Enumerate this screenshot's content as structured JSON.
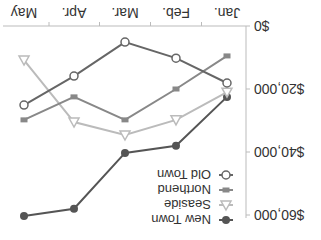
{
  "chart_data": {
    "type": "line",
    "title": "",
    "xlabel": "",
    "ylabel": "",
    "categories": [
      "Jan.",
      "Feb.",
      "Mar.",
      "Apr.",
      "May"
    ],
    "y_ticks": [
      "$0",
      "$20,000",
      "$40,000",
      "$60,000"
    ],
    "ylim": [
      0,
      60000
    ],
    "grid": false,
    "legend_position": "upper-left",
    "series": [
      {
        "name": "New Town",
        "marker": "filled-circle",
        "color": "#555555",
        "values": [
          22500,
          38000,
          40300,
          58000,
          60300
        ]
      },
      {
        "name": "Seaside",
        "marker": "open-triangle",
        "color": "#bbbbbb",
        "values": [
          21000,
          29800,
          34600,
          30500,
          10800
        ]
      },
      {
        "name": "Northend",
        "marker": "filled-square",
        "color": "#888888",
        "values": [
          9500,
          20000,
          29800,
          22500,
          29800
        ]
      },
      {
        "name": "Old Town",
        "marker": "open-circle",
        "color": "#666666",
        "values": [
          18100,
          10200,
          5100,
          15900,
          25100
        ]
      }
    ]
  },
  "display": {
    "rotation_degrees": 180
  }
}
